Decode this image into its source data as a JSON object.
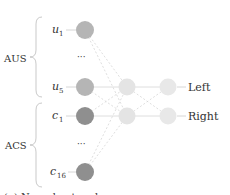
{
  "groups": [
    {
      "label": "AUS",
      "inputs": [
        {
          "name": "u",
          "sub": "1"
        },
        {
          "name": "u",
          "sub": "5"
        }
      ]
    },
    {
      "label": "ACS",
      "inputs": [
        {
          "name": "c",
          "sub": "1"
        },
        {
          "name": "c",
          "sub": "16"
        }
      ]
    }
  ],
  "ellipsis": "···",
  "outputs": [
    {
      "label": "Left"
    },
    {
      "label": "Right"
    }
  ],
  "colors": {
    "aus_node": "#b5b5b5",
    "acs_node": "#8f8f8f",
    "hidden_node": "#e4e4e4",
    "output_node": "#e8e8e8",
    "edge": "#d0d0d0"
  },
  "caption": "(a) Neural network ..."
}
